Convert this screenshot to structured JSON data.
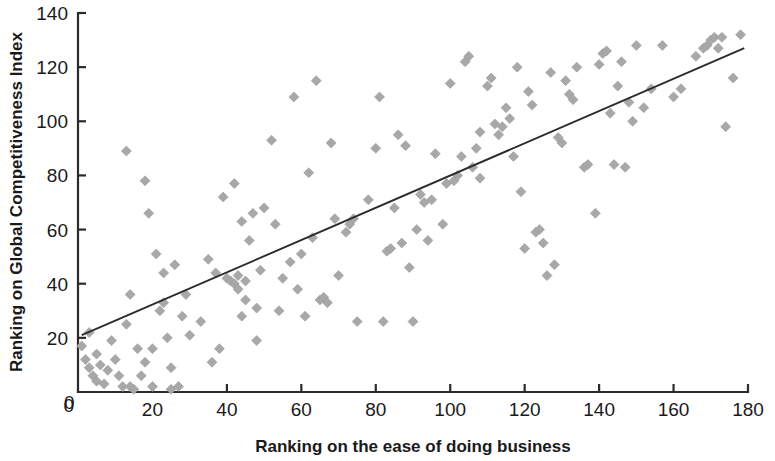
{
  "chart_data": {
    "type": "scatter",
    "title": "",
    "subtitle": "",
    "xlabel": "Ranking on the ease of doing business",
    "ylabel": "Ranking on Global Competitiveness Index",
    "xlim": [
      0,
      180
    ],
    "ylim": [
      0,
      140
    ],
    "xticks": [
      0,
      20,
      40,
      60,
      80,
      100,
      120,
      140,
      160,
      180
    ],
    "yticks": [
      0,
      20,
      40,
      60,
      80,
      100,
      120,
      140
    ],
    "grid": false,
    "legend": null,
    "legend_position": "none",
    "marker_shape": "diamond",
    "marker_color": "#a8a8a8",
    "marker_size": 10,
    "trendline": {
      "visible": true,
      "color": "#2b2b2b",
      "x_start": 1,
      "y_start": 21,
      "x_end": 179,
      "y_end": 127
    },
    "points": [
      [
        1,
        17
      ],
      [
        2,
        12
      ],
      [
        3,
        9
      ],
      [
        3,
        22
      ],
      [
        4,
        6
      ],
      [
        5,
        14
      ],
      [
        5,
        4
      ],
      [
        6,
        10
      ],
      [
        7,
        3
      ],
      [
        8,
        8
      ],
      [
        9,
        19
      ],
      [
        10,
        12
      ],
      [
        11,
        6
      ],
      [
        12,
        2
      ],
      [
        13,
        89
      ],
      [
        13,
        25
      ],
      [
        14,
        2
      ],
      [
        14,
        36
      ],
      [
        15,
        1
      ],
      [
        16,
        16
      ],
      [
        17,
        6
      ],
      [
        18,
        78
      ],
      [
        18,
        11
      ],
      [
        19,
        66
      ],
      [
        20,
        16
      ],
      [
        20,
        2
      ],
      [
        21,
        51
      ],
      [
        22,
        30
      ],
      [
        23,
        44
      ],
      [
        23,
        33
      ],
      [
        24,
        20
      ],
      [
        25,
        1
      ],
      [
        25,
        9
      ],
      [
        26,
        47
      ],
      [
        27,
        2
      ],
      [
        28,
        28
      ],
      [
        29,
        36
      ],
      [
        30,
        21
      ],
      [
        33,
        26
      ],
      [
        35,
        49
      ],
      [
        36,
        11
      ],
      [
        37,
        44
      ],
      [
        38,
        16
      ],
      [
        39,
        72
      ],
      [
        40,
        42
      ],
      [
        41,
        41
      ],
      [
        42,
        40
      ],
      [
        42,
        77
      ],
      [
        43,
        43
      ],
      [
        43,
        38
      ],
      [
        44,
        63
      ],
      [
        44,
        28
      ],
      [
        45,
        41
      ],
      [
        45,
        34
      ],
      [
        46,
        56
      ],
      [
        47,
        66
      ],
      [
        48,
        31
      ],
      [
        48,
        19
      ],
      [
        49,
        45
      ],
      [
        50,
        68
      ],
      [
        52,
        93
      ],
      [
        53,
        62
      ],
      [
        54,
        30
      ],
      [
        55,
        42
      ],
      [
        57,
        48
      ],
      [
        58,
        109
      ],
      [
        59,
        38
      ],
      [
        60,
        51
      ],
      [
        61,
        28
      ],
      [
        62,
        81
      ],
      [
        63,
        57
      ],
      [
        64,
        115
      ],
      [
        65,
        34
      ],
      [
        66,
        35
      ],
      [
        67,
        33
      ],
      [
        68,
        92
      ],
      [
        69,
        64
      ],
      [
        70,
        43
      ],
      [
        72,
        59
      ],
      [
        73,
        62
      ],
      [
        74,
        64
      ],
      [
        75,
        26
      ],
      [
        78,
        71
      ],
      [
        80,
        90
      ],
      [
        81,
        109
      ],
      [
        82,
        26
      ],
      [
        83,
        52
      ],
      [
        84,
        53
      ],
      [
        85,
        68
      ],
      [
        86,
        95
      ],
      [
        87,
        55
      ],
      [
        88,
        91
      ],
      [
        89,
        46
      ],
      [
        90,
        26
      ],
      [
        91,
        60
      ],
      [
        92,
        73
      ],
      [
        93,
        70
      ],
      [
        94,
        56
      ],
      [
        95,
        71
      ],
      [
        96,
        88
      ],
      [
        98,
        62
      ],
      [
        99,
        77
      ],
      [
        100,
        114
      ],
      [
        101,
        78
      ],
      [
        102,
        80
      ],
      [
        103,
        87
      ],
      [
        104,
        122
      ],
      [
        105,
        124
      ],
      [
        106,
        83
      ],
      [
        107,
        90
      ],
      [
        108,
        96
      ],
      [
        108,
        79
      ],
      [
        110,
        113
      ],
      [
        111,
        116
      ],
      [
        112,
        99
      ],
      [
        113,
        95
      ],
      [
        114,
        98
      ],
      [
        115,
        105
      ],
      [
        116,
        101
      ],
      [
        117,
        87
      ],
      [
        118,
        120
      ],
      [
        119,
        74
      ],
      [
        120,
        53
      ],
      [
        121,
        111
      ],
      [
        122,
        106
      ],
      [
        123,
        59
      ],
      [
        124,
        60
      ],
      [
        125,
        55
      ],
      [
        126,
        43
      ],
      [
        127,
        118
      ],
      [
        128,
        47
      ],
      [
        129,
        94
      ],
      [
        130,
        92
      ],
      [
        131,
        115
      ],
      [
        132,
        110
      ],
      [
        133,
        108
      ],
      [
        134,
        120
      ],
      [
        136,
        83
      ],
      [
        137,
        84
      ],
      [
        139,
        66
      ],
      [
        140,
        121
      ],
      [
        141,
        125
      ],
      [
        142,
        126
      ],
      [
        143,
        103
      ],
      [
        144,
        84
      ],
      [
        145,
        113
      ],
      [
        146,
        122
      ],
      [
        147,
        83
      ],
      [
        148,
        107
      ],
      [
        149,
        100
      ],
      [
        150,
        128
      ],
      [
        152,
        105
      ],
      [
        154,
        112
      ],
      [
        157,
        128
      ],
      [
        160,
        109
      ],
      [
        162,
        112
      ],
      [
        166,
        124
      ],
      [
        168,
        127
      ],
      [
        169,
        128
      ],
      [
        170,
        130
      ],
      [
        171,
        131
      ],
      [
        172,
        127
      ],
      [
        173,
        131
      ],
      [
        174,
        98
      ],
      [
        176,
        116
      ],
      [
        178,
        132
      ]
    ]
  },
  "axes": {
    "x_label": "Ranking on the ease of doing business",
    "y_label": "Ranking on Global Competitiveness Index",
    "x_tick_labels": [
      "0",
      "20",
      "40",
      "60",
      "80",
      "100",
      "120",
      "140",
      "160",
      "180"
    ],
    "y_tick_labels": [
      "0",
      "20",
      "40",
      "60",
      "80",
      "100",
      "120",
      "140"
    ]
  },
  "colors": {
    "marker": "#a8a8a8",
    "axis": "#2b2b2b",
    "trendline": "#2b2b2b",
    "background": "#ffffff"
  }
}
